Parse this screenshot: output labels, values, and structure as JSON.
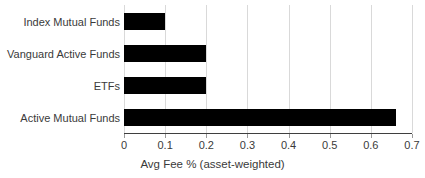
{
  "chart_data": {
    "type": "bar",
    "orientation": "horizontal",
    "title": "",
    "xlabel": "Avg Fee % (asset-weighted)",
    "ylabel": "",
    "categories": [
      "Index Mutual Funds",
      "Vanguard Active Funds",
      "ETFs",
      "Active Mutual Funds"
    ],
    "values": [
      0.1,
      0.2,
      0.2,
      0.66
    ],
    "xlim": [
      0,
      0.7
    ],
    "xticks": [
      0,
      0.1,
      0.2,
      0.3,
      0.4,
      0.5,
      0.6,
      0.7
    ],
    "xtick_labels": [
      "0",
      "0.1",
      "0.2",
      "0.3",
      "0.4",
      "0.5",
      "0.6",
      "0.7"
    ],
    "grid": "vertical",
    "legend": "none",
    "bar_color": "#000000",
    "gridline_color": "#d9d9d9",
    "axis_color": "#3f3f3f",
    "text_color": "#3a3a3a",
    "background_color": "#ffffff"
  }
}
